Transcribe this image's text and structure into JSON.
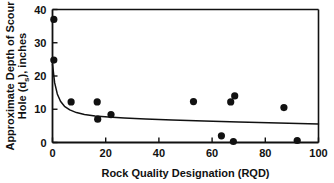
{
  "chart_data": {
    "type": "scatter",
    "title": "",
    "xlabel": "Rock Quality Designation (RQD)",
    "ylabel_line1": "Approximate Depth of Scour",
    "ylabel_line2": "Hole (d",
    "ylabel_sub": "s",
    "ylabel_line3": "), inches",
    "ylabel_full": "Approximate Depth of Scour Hole (ds), inches",
    "xlim": [
      0,
      100
    ],
    "ylim": [
      0,
      40
    ],
    "xticks": [
      0,
      20,
      40,
      60,
      80,
      100
    ],
    "xtick_labels": [
      "0",
      "20",
      "40",
      "60",
      "80",
      "100"
    ],
    "yticks": [
      0,
      10,
      20,
      30,
      40
    ],
    "ytick_labels": [
      "0",
      "10",
      "20",
      "30",
      "40"
    ],
    "grid": false,
    "legend": "none",
    "marker": "filled-circle",
    "marker_color": "#111111",
    "curve_color": "#111111",
    "points": [
      {
        "x": 0.5,
        "y": 37.0
      },
      {
        "x": 0.5,
        "y": 24.8
      },
      {
        "x": 7.0,
        "y": 12.2
      },
      {
        "x": 16.8,
        "y": 12.2
      },
      {
        "x": 17.0,
        "y": 7.0
      },
      {
        "x": 22.0,
        "y": 8.4
      },
      {
        "x": 53.0,
        "y": 12.3
      },
      {
        "x": 67.0,
        "y": 12.2
      },
      {
        "x": 68.5,
        "y": 14.0
      },
      {
        "x": 63.5,
        "y": 2.0
      },
      {
        "x": 68.0,
        "y": 0.3
      },
      {
        "x": 87.0,
        "y": 10.5
      },
      {
        "x": 92.0,
        "y": 0.6
      }
    ],
    "fit_curve": [
      {
        "x": 0.0,
        "y": 23.5
      },
      {
        "x": 0.8,
        "y": 18.0
      },
      {
        "x": 1.8,
        "y": 14.6
      },
      {
        "x": 3.0,
        "y": 12.4
      },
      {
        "x": 4.5,
        "y": 10.9
      },
      {
        "x": 6.5,
        "y": 9.8
      },
      {
        "x": 9.0,
        "y": 9.0
      },
      {
        "x": 12.0,
        "y": 8.4
      },
      {
        "x": 16.0,
        "y": 8.0
      },
      {
        "x": 21.0,
        "y": 7.7
      },
      {
        "x": 27.0,
        "y": 7.4
      },
      {
        "x": 35.0,
        "y": 7.1
      },
      {
        "x": 45.0,
        "y": 6.8
      },
      {
        "x": 57.0,
        "y": 6.5
      },
      {
        "x": 70.0,
        "y": 6.2
      },
      {
        "x": 85.0,
        "y": 5.9
      },
      {
        "x": 100.0,
        "y": 5.6
      }
    ]
  }
}
